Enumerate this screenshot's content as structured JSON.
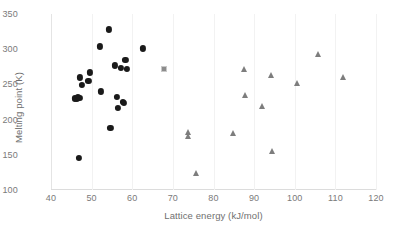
{
  "chart_data": {
    "type": "scatter",
    "title": "",
    "subtitle": "",
    "xlabel": "Lattice energy (kJ/mol)",
    "ylabel": "Melting point (K)",
    "xlim": [
      40,
      120
    ],
    "ylim": [
      100,
      350
    ],
    "xticks": [
      40,
      50,
      60,
      70,
      80,
      90,
      100,
      110,
      120
    ],
    "yticks": [
      100,
      150,
      200,
      250,
      300,
      350
    ],
    "grid": "faint vertical gridlines at x major ticks",
    "legend": "none",
    "annotations": [],
    "series": [
      {
        "name": "black-circles",
        "marker": "circle",
        "color": "#1a1a1a",
        "points": [
          [
            45.9,
            230
          ],
          [
            46.3,
            229
          ],
          [
            46.6,
            232
          ],
          [
            47.0,
            231
          ],
          [
            47.1,
            260
          ],
          [
            47.6,
            249
          ],
          [
            46.9,
            146
          ],
          [
            49.2,
            255
          ],
          [
            49.6,
            267
          ],
          [
            52.0,
            304
          ],
          [
            52.2,
            240
          ],
          [
            54.2,
            328
          ],
          [
            54.6,
            188
          ],
          [
            55.7,
            277
          ],
          [
            56.3,
            232
          ],
          [
            56.5,
            217
          ],
          [
            57.6,
            225
          ],
          [
            58.0,
            224
          ],
          [
            58.3,
            285
          ],
          [
            58.6,
            272
          ],
          [
            57.2,
            273
          ],
          [
            62.6,
            301
          ]
        ]
      },
      {
        "name": "gray-square",
        "marker": "square",
        "color": "#8c8c8c",
        "points": [
          [
            67.9,
            272
          ]
        ]
      },
      {
        "name": "gray-triangles",
        "marker": "triangle",
        "color": "#7d7d7d",
        "points": [
          [
            73.6,
            183
          ],
          [
            73.7,
            176
          ],
          [
            75.6,
            124
          ],
          [
            84.8,
            181
          ],
          [
            87.4,
            272
          ],
          [
            87.8,
            235
          ],
          [
            91.9,
            219
          ],
          [
            94.2,
            263
          ],
          [
            94.4,
            155
          ],
          [
            100.6,
            252
          ],
          [
            105.6,
            293
          ],
          [
            111.8,
            261
          ]
        ]
      }
    ]
  }
}
